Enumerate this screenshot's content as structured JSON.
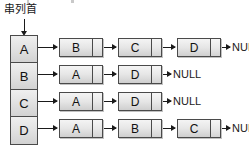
{
  "diagram": {
    "head_label": "串列首",
    "null_text": "NULL",
    "colors": {
      "node_fill": "#e6e6e6",
      "node_border": "#4a4a4a",
      "head_fill": "#e3e3e3",
      "arrow": "#1a1a1a",
      "background": "#ffffff"
    },
    "head_array": [
      {
        "label": "A"
      },
      {
        "label": "B"
      },
      {
        "label": "C"
      },
      {
        "label": "D"
      }
    ],
    "rows": [
      {
        "head": "A",
        "nodes": [
          {
            "label": "B"
          },
          {
            "label": "C"
          },
          {
            "label": "D"
          }
        ],
        "terminator": "NULL"
      },
      {
        "head": "B",
        "nodes": [
          {
            "label": "A"
          },
          {
            "label": "D"
          }
        ],
        "terminator": "NULL"
      },
      {
        "head": "C",
        "nodes": [
          {
            "label": "A"
          },
          {
            "label": "D"
          }
        ],
        "terminator": "NULL"
      },
      {
        "head": "D",
        "nodes": [
          {
            "label": "A"
          },
          {
            "label": "B"
          },
          {
            "label": "C"
          }
        ],
        "terminator": "NULL"
      }
    ]
  }
}
